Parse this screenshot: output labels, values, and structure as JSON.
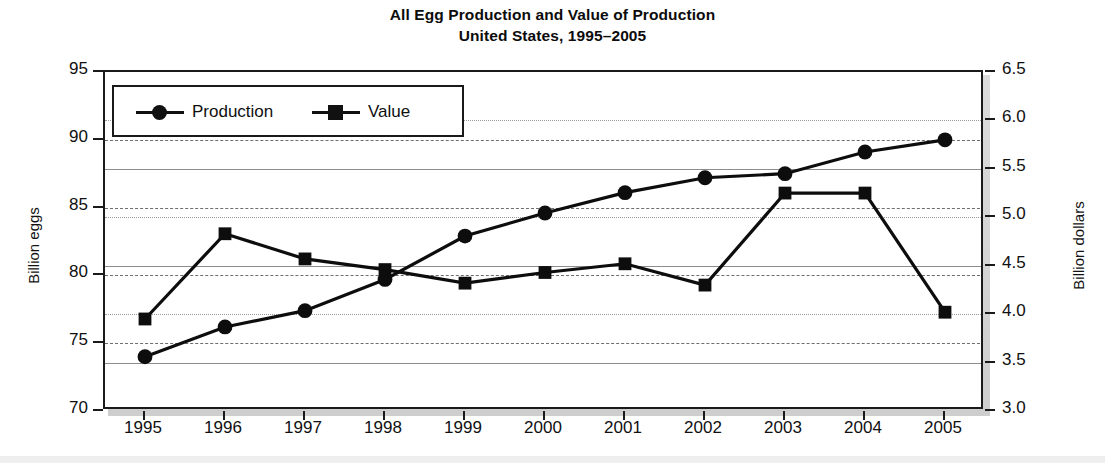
{
  "title": {
    "line1": "All Egg Production and Value of Production",
    "line2": "United States, 1995–2005"
  },
  "axes": {
    "y_left_label": "Billion eggs",
    "y_right_label": "Billion dollars",
    "y_left_ticks": [
      "70",
      "75",
      "80",
      "85",
      "90",
      "95"
    ],
    "y_right_ticks": [
      "3.0",
      "3.5",
      "4.0",
      "4.5",
      "5.0",
      "5.5",
      "6.0",
      "6.5"
    ],
    "x_ticks": [
      "1995",
      "1996",
      "1997",
      "1998",
      "1999",
      "2000",
      "2001",
      "2002",
      "2003",
      "2004",
      "2005"
    ]
  },
  "legend": {
    "production_label": "Production",
    "value_label": "Value"
  },
  "colors": {
    "series": "#0d0d0d",
    "frame": "#1a1a1a",
    "grid_solid": "#8d8d8d",
    "grid_dashed": "#6e6e6e",
    "background": "#ffffff"
  },
  "chart_data": {
    "type": "line",
    "title": "All Egg Production and Value of Production United States, 1995–2005",
    "subtitle": "United States, 1995–2005",
    "xlabel": "",
    "ylabel": "Billion eggs",
    "y2label": "Billion dollars",
    "x": [
      1995,
      1996,
      1997,
      1998,
      1999,
      2000,
      2001,
      2002,
      2003,
      2004,
      2005
    ],
    "categories": [
      "1995",
      "1996",
      "1997",
      "1998",
      "1999",
      "2000",
      "2001",
      "2002",
      "2003",
      "2004",
      "2005"
    ],
    "ylim": [
      70,
      95
    ],
    "y2lim": [
      3.0,
      6.5
    ],
    "yticks": [
      70,
      75,
      80,
      85,
      90,
      95
    ],
    "y2ticks": [
      3.0,
      3.5,
      4.0,
      4.5,
      5.0,
      5.5,
      6.0,
      6.5
    ],
    "grid": true,
    "legend_position": "upper-left-inside",
    "series": [
      {
        "name": "Production",
        "axis": "left",
        "units": "Billion eggs",
        "marker": "circle",
        "values": [
          74.0,
          76.2,
          77.4,
          79.7,
          82.9,
          84.6,
          86.1,
          87.2,
          87.5,
          89.1,
          90.0
        ]
      },
      {
        "name": "Value",
        "axis": "right",
        "units": "Billion dollars",
        "marker": "square",
        "values": [
          3.95,
          4.83,
          4.57,
          4.46,
          4.32,
          4.43,
          4.52,
          4.3,
          5.25,
          5.25,
          4.02
        ]
      }
    ]
  }
}
